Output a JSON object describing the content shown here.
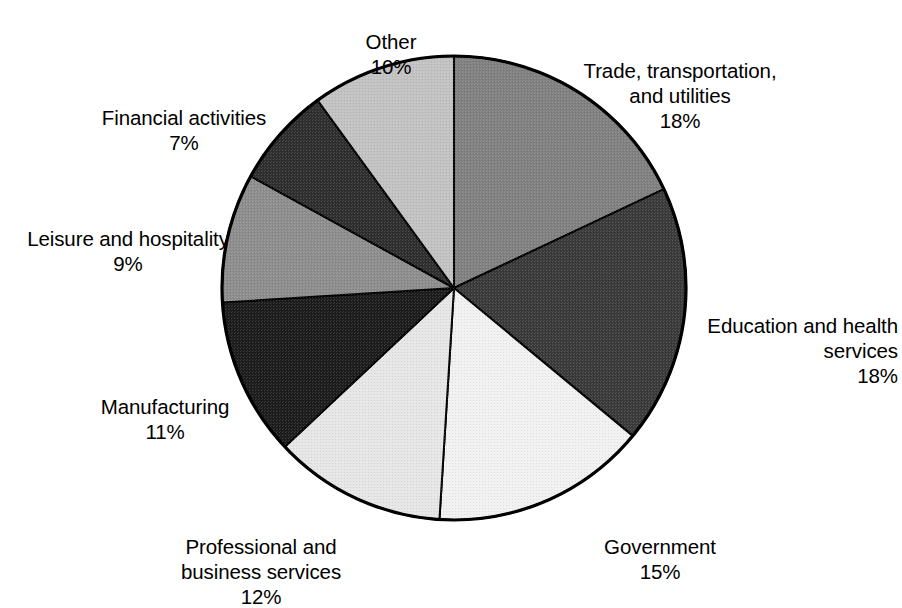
{
  "chart_data": {
    "type": "pie",
    "title": "",
    "subtitle": "",
    "xlabel": "",
    "ylabel": "",
    "legend_position": "none",
    "grid": false,
    "units": "percent",
    "total": 100,
    "start_angle_deg": 0,
    "direction": "clockwise",
    "categories": [
      "Trade, transportation, and utilities",
      "Education and health services",
      "Government",
      "Professional and business services",
      "Manufacturing",
      "Leisure and hospitality",
      "Financial activities",
      "Other"
    ],
    "values": [
      18,
      18,
      15,
      12,
      11,
      9,
      7,
      10
    ],
    "slices": [
      {
        "key": "trade",
        "name": "Trade, transportation,\nand utilities",
        "name_plain": "Trade, transportation, and utilities",
        "value": 18,
        "percent_label": "18%",
        "color": "#808080",
        "start_deg": 0,
        "end_deg": 64.8
      },
      {
        "key": "education",
        "name": "Education and health\nservices",
        "name_plain": "Education and health services",
        "value": 18,
        "percent_label": "18%",
        "color": "#3a3a3a",
        "start_deg": 64.8,
        "end_deg": 129.6
      },
      {
        "key": "government",
        "name": "Government",
        "name_plain": "Government",
        "value": 15,
        "percent_label": "15%",
        "color": "#f1f1f1",
        "start_deg": 129.6,
        "end_deg": 183.6
      },
      {
        "key": "professional",
        "name": "Professional and\nbusiness services",
        "name_plain": "Professional and business services",
        "value": 12,
        "percent_label": "12%",
        "color": "#e6e6e6",
        "start_deg": 183.6,
        "end_deg": 226.8
      },
      {
        "key": "manufacturing",
        "name": "Manufacturing",
        "name_plain": "Manufacturing",
        "value": 11,
        "percent_label": "11%",
        "color": "#1c1c1c",
        "start_deg": 226.8,
        "end_deg": 266.4
      },
      {
        "key": "leisure",
        "name": "Leisure and hospitality",
        "name_plain": "Leisure and hospitality",
        "value": 9,
        "percent_label": "9%",
        "color": "#8d8d8d",
        "start_deg": 266.4,
        "end_deg": 298.8
      },
      {
        "key": "financial",
        "name": "Financial activities",
        "name_plain": "Financial activities",
        "value": 7,
        "percent_label": "7%",
        "color": "#2e2e2e",
        "start_deg": 298.8,
        "end_deg": 324.0
      },
      {
        "key": "other",
        "name": "Other",
        "name_plain": "Other",
        "value": 10,
        "percent_label": "10%",
        "color": "#c2c2c2",
        "start_deg": 324.0,
        "end_deg": 360.0
      }
    ],
    "geometry": {
      "center_x": 454,
      "center_y": 288,
      "radius": 232
    },
    "style": {
      "outline_color": "#000000",
      "background": "#ffffff"
    }
  }
}
